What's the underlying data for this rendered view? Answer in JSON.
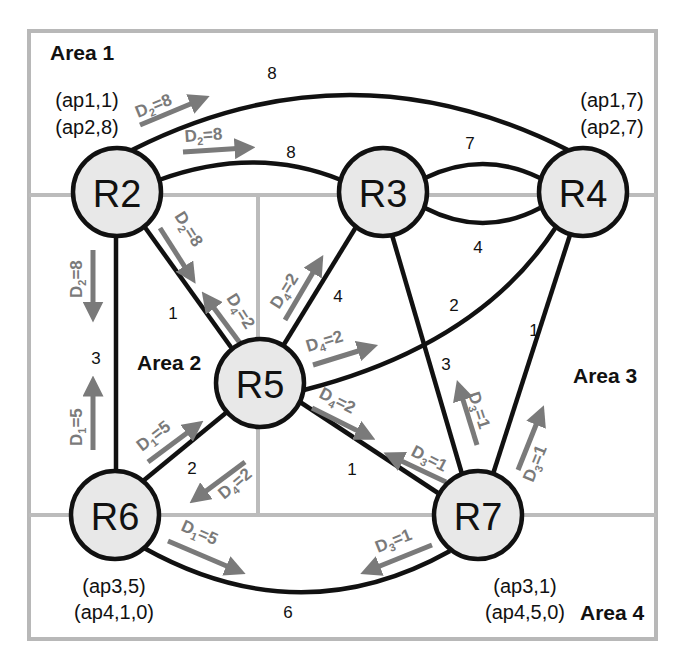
{
  "areas": [
    {
      "id": "area1",
      "label": "Area 1",
      "x": 50,
      "y": 60
    },
    {
      "id": "area2",
      "label": "Area 2",
      "x": 137,
      "y": 370
    },
    {
      "id": "area3",
      "label": "Area 3",
      "x": 573,
      "y": 383
    },
    {
      "id": "area4",
      "label": "Area 4",
      "x": 580,
      "y": 620
    }
  ],
  "nodes": [
    {
      "id": "R2",
      "label": "R2",
      "cx": 117,
      "cy": 192
    },
    {
      "id": "R3",
      "label": "R3",
      "cx": 383,
      "cy": 192
    },
    {
      "id": "R4",
      "label": "R4",
      "cx": 583,
      "cy": 192
    },
    {
      "id": "R5",
      "label": "R5",
      "cx": 260,
      "cy": 383
    },
    {
      "id": "R6",
      "label": "R6",
      "cx": 115,
      "cy": 515
    },
    {
      "id": "R7",
      "label": "R7",
      "cx": 478,
      "cy": 515
    }
  ],
  "edges": [
    {
      "from": "R2",
      "to": "R4",
      "weight": "8",
      "label_x": 272,
      "label_y": 73
    },
    {
      "from": "R2",
      "to": "R3",
      "weight": "8",
      "label_x": 291,
      "label_y": 152
    },
    {
      "from": "R3",
      "to": "R4",
      "weight": "7",
      "label_x": 470,
      "label_y": 143,
      "note": "upper arc"
    },
    {
      "from": "R3",
      "to": "R4",
      "weight": "4",
      "label_x": 478,
      "label_y": 247,
      "note": "lower arc"
    },
    {
      "from": "R2",
      "to": "R6",
      "weight": "3",
      "label_x": 96,
      "label_y": 358
    },
    {
      "from": "R2",
      "to": "R5",
      "weight": "1",
      "label_x": 173,
      "label_y": 313
    },
    {
      "from": "R3",
      "to": "R5",
      "weight": "4",
      "label_x": 338,
      "label_y": 296
    },
    {
      "from": "R4",
      "to": "R5",
      "weight": "2",
      "label_x": 454,
      "label_y": 305
    },
    {
      "from": "R3",
      "to": "R7",
      "weight": "3",
      "label_x": 446,
      "label_y": 364
    },
    {
      "from": "R4",
      "to": "R7",
      "weight": "1",
      "label_x": 534,
      "label_y": 330
    },
    {
      "from": "R5",
      "to": "R6",
      "weight": "2",
      "label_x": 192,
      "label_y": 468
    },
    {
      "from": "R5",
      "to": "R7",
      "weight": "1",
      "label_x": 352,
      "label_y": 469
    },
    {
      "from": "R6",
      "to": "R7",
      "weight": "6",
      "label_x": 288,
      "label_y": 612
    }
  ],
  "node_annotations": [
    {
      "node": "R2",
      "lines": [
        "(ap1,1)",
        "(ap2,8)"
      ],
      "x": 87,
      "y": 107
    },
    {
      "node": "R4",
      "lines": [
        "(ap1,7)",
        "(ap2,7)"
      ],
      "x": 612,
      "y": 107
    },
    {
      "node": "R6",
      "lines": [
        "(ap3,5)",
        "(ap4,1,0)"
      ],
      "x": 114,
      "y": 593
    },
    {
      "node": "R7",
      "lines": [
        "(ap3,1)",
        "(ap4,5,0)"
      ],
      "x": 525,
      "y": 593
    }
  ],
  "flow_labels": [
    {
      "d": "D",
      "sub": "2",
      "val": "=8",
      "desc": "R2 to R4 top arc"
    },
    {
      "d": "D",
      "sub": "2",
      "val": "=8",
      "desc": "R2 to R3"
    },
    {
      "d": "D",
      "sub": "2",
      "val": "=8",
      "desc": "R2 to R5"
    },
    {
      "d": "D",
      "sub": "2",
      "val": "=8",
      "desc": "R2 to R6"
    },
    {
      "d": "D",
      "sub": "4",
      "val": "=2",
      "desc": "R5 to R2"
    },
    {
      "d": "D",
      "sub": "4",
      "val": "=2",
      "desc": "R5 to R3"
    },
    {
      "d": "D",
      "sub": "4",
      "val": "=2",
      "desc": "R5 to R4"
    },
    {
      "d": "D",
      "sub": "4",
      "val": "=2",
      "desc": "R5 to R7"
    },
    {
      "d": "D",
      "sub": "4",
      "val": "=2",
      "desc": "R5 to R6"
    },
    {
      "d": "D",
      "sub": "1",
      "val": "=5",
      "desc": "R6 to R2"
    },
    {
      "d": "D",
      "sub": "1",
      "val": "=5",
      "desc": "R6 to R5"
    },
    {
      "d": "D",
      "sub": "1",
      "val": "=5",
      "desc": "R6 to R7"
    },
    {
      "d": "D",
      "sub": "3",
      "val": "=1",
      "desc": "R7 to R5"
    },
    {
      "d": "D",
      "sub": "3",
      "val": "=1",
      "desc": "R7 to R3"
    },
    {
      "d": "D",
      "sub": "3",
      "val": "=1",
      "desc": "R7 to R4"
    },
    {
      "d": "D",
      "sub": "3",
      "val": "=1",
      "desc": "R7 to R6"
    }
  ],
  "colors": {
    "node_fill": "#e8e8e8",
    "edge": "#111111",
    "flow_arrow": "#7a7a7a",
    "area_border": "#b8b8b8"
  }
}
